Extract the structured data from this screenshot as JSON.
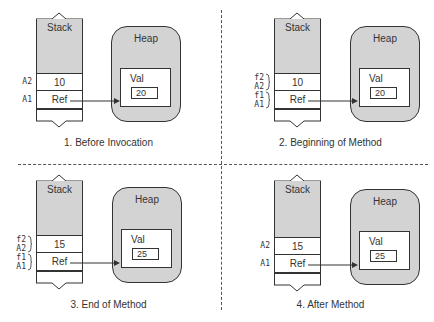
{
  "diagram": {
    "title": "",
    "panels": [
      {
        "caption": "1. Before Invocation",
        "stack_label": "Stack",
        "heap_label": "Heap",
        "val_label": "Val",
        "rows": [
          {
            "labels": [
              "A2"
            ],
            "value": "10"
          },
          {
            "labels": [
              "A1"
            ],
            "value": "Ref"
          }
        ],
        "heap_value": "20"
      },
      {
        "caption": "2. Beginning of Method",
        "stack_label": "Stack",
        "heap_label": "Heap",
        "val_label": "Val",
        "rows": [
          {
            "labels": [
              "f2",
              "A2"
            ],
            "value": "10"
          },
          {
            "labels": [
              "f1",
              "A1"
            ],
            "value": "Ref"
          }
        ],
        "heap_value": "20"
      },
      {
        "caption": "3. End of Method",
        "stack_label": "Stack",
        "heap_label": "Heap",
        "val_label": "Val",
        "rows": [
          {
            "labels": [
              "f2",
              "A2"
            ],
            "value": "15"
          },
          {
            "labels": [
              "f1",
              "A1"
            ],
            "value": "Ref"
          }
        ],
        "heap_value": "25"
      },
      {
        "caption": "4. After Method",
        "stack_label": "Stack",
        "heap_label": "Heap",
        "val_label": "Val",
        "rows": [
          {
            "labels": [
              "A2"
            ],
            "value": "15"
          },
          {
            "labels": [
              "A1"
            ],
            "value": "Ref"
          }
        ],
        "heap_value": "25"
      }
    ],
    "colors": {
      "stack_fill": "#d3d3d3",
      "heap_fill": "#d3d3d3",
      "stroke": "#333333",
      "background": "#ffffff"
    }
  }
}
